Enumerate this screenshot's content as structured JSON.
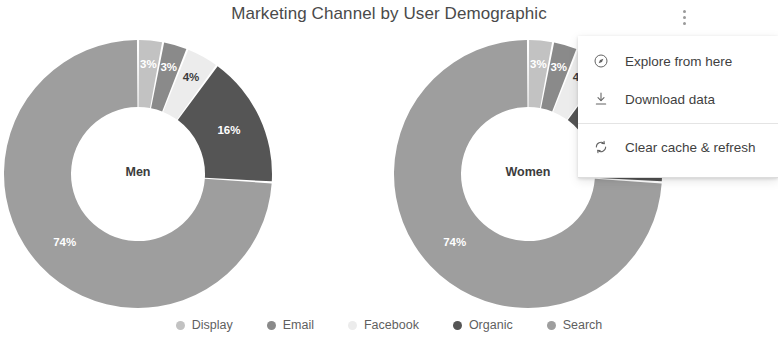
{
  "header": {
    "title": "Marketing Channel by User Demographic",
    "kebab_icon": "more-vert-icon"
  },
  "overflow_menu": {
    "items": [
      {
        "label": "Explore from here",
        "icon": "compass-icon"
      },
      {
        "label": "Download data",
        "icon": "download-icon"
      },
      {
        "label": "Clear cache & refresh",
        "icon": "refresh-icon"
      }
    ]
  },
  "legend": {
    "items": [
      {
        "label": "Display",
        "color": "#c2c2c2"
      },
      {
        "label": "Email",
        "color": "#8a8a8a"
      },
      {
        "label": "Facebook",
        "color": "#ececec"
      },
      {
        "label": "Organic",
        "color": "#555555"
      },
      {
        "label": "Search",
        "color": "#9e9e9e"
      }
    ]
  },
  "chart_data": {
    "type": "pie",
    "title": "Marketing Channel by User Demographic",
    "subtitle": "",
    "xlabel": "",
    "ylabel": "",
    "donut": true,
    "legend_position": "bottom",
    "grid": false,
    "value_unit": "%",
    "categories": [
      "Display",
      "Email",
      "Facebook",
      "Organic",
      "Search"
    ],
    "colors": [
      "#c2c2c2",
      "#8a8a8a",
      "#ececec",
      "#555555",
      "#9e9e9e"
    ],
    "charts": [
      {
        "name": "Men",
        "center_label": "Men",
        "values": [
          3,
          3,
          4,
          16,
          74
        ],
        "labels": [
          "3%",
          "3%",
          "4%",
          "16%",
          "74%"
        ]
      },
      {
        "name": "Women",
        "center_label": "Women",
        "values": [
          3,
          3,
          4,
          16,
          74
        ],
        "labels": [
          "3%",
          "3%",
          "4%",
          "16%",
          "74%"
        ]
      }
    ]
  }
}
